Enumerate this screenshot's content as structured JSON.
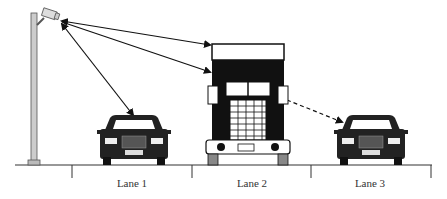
{
  "diagram": {
    "lanes": [
      {
        "label": "Lane 1",
        "vehicle": "car"
      },
      {
        "label": "Lane 2",
        "vehicle": "truck"
      },
      {
        "label": "Lane 3",
        "vehicle": "car"
      }
    ],
    "sightlines": [
      {
        "from": "camera",
        "to": "truck-top",
        "style": "solid"
      },
      {
        "from": "camera",
        "to": "truck-cab",
        "style": "solid"
      },
      {
        "from": "camera",
        "to": "car-lane-1",
        "style": "solid"
      },
      {
        "from": "truck",
        "to": "car-lane-3",
        "style": "dashed"
      }
    ]
  }
}
